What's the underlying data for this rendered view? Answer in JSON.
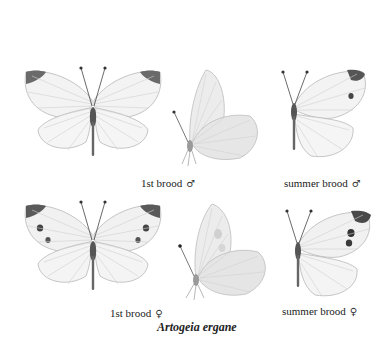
{
  "plate": {
    "species": "Artogeia ergane",
    "figures": [
      {
        "id": "fig-1st-male-upper",
        "caption": "1st brood",
        "sex": "♂"
      },
      {
        "id": "fig-1st-male-under",
        "caption": "",
        "sex": ""
      },
      {
        "id": "fig-summer-male",
        "caption": "summer brood",
        "sex": "♂"
      },
      {
        "id": "fig-1st-female-upper",
        "caption": "1st brood",
        "sex": "♀"
      },
      {
        "id": "fig-1st-female-under",
        "caption": "",
        "sex": ""
      },
      {
        "id": "fig-summer-female",
        "caption": "summer brood",
        "sex": "♀"
      }
    ]
  },
  "colors": {
    "wing": "#f3f3f3",
    "vein": "#c8c8c8",
    "tip": "#555555",
    "body": "#555555",
    "under": "#e9e9e9"
  }
}
